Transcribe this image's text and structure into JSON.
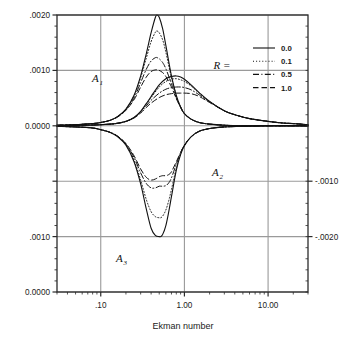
{
  "chart_data": {
    "type": "line",
    "title": "",
    "xlabel": "Ekman number",
    "ylabel": "",
    "xscale": "log",
    "xlim": [
      0.03,
      30.0
    ],
    "xticks": [
      0.1,
      1.0,
      10.0
    ],
    "xticklabels": [
      ".10",
      "1.00",
      "10.00"
    ],
    "grid": true,
    "grid_color": "#9a9a9a",
    "axes_color": "#2b2b2b",
    "background": "#ffffff",
    "left_axis": {
      "ticks_value": [
        0.002,
        0.001,
        0.0,
        -0.001,
        -0.002,
        -0.003
      ],
      "ticklabels": [
        ".0020",
        ".0010",
        "0.0000",
        "",
        ".0010",
        "0.0000"
      ],
      "ylim": [
        -0.003,
        0.002
      ]
    },
    "right_axis": {
      "ticks_value": [
        -0.001,
        -0.002
      ],
      "ticklabels": [
        "-.0010",
        "-.0020"
      ]
    },
    "legend": {
      "title": "R =",
      "position": "top-right",
      "entries": [
        {
          "label": "0.0",
          "style": "solid"
        },
        {
          "label": "0.1",
          "style": "dotted"
        },
        {
          "label": "0.5",
          "style": "dashdot"
        },
        {
          "label": "1.0",
          "style": "dashed"
        }
      ]
    },
    "annotations": [
      {
        "text": "A",
        "sub": "1",
        "x_px": 92,
        "y_px": 82
      },
      {
        "text": "A",
        "sub": "2",
        "x_px": 212,
        "y_px": 176
      },
      {
        "text": "A",
        "sub": "3",
        "x_px": 116,
        "y_px": 262
      }
    ],
    "series_groups": [
      {
        "name": "A1",
        "description": "Upper positive lobe, peak near E = 0.47",
        "series": [
          {
            "name": "R = 0.0",
            "style": "solid",
            "x": [
              0.03,
              0.05,
              0.08,
              0.1,
              0.13,
              0.16,
              0.2,
              0.25,
              0.3,
              0.35,
              0.4,
              0.45,
              0.47,
              0.5,
              0.55,
              0.6,
              0.7,
              0.8,
              0.9,
              1.0,
              1.2,
              1.5,
              2.0,
              3.0,
              5.0,
              10.0,
              20.0,
              30.0
            ],
            "y": [
              1e-05,
              2e-05,
              4e-05,
              6e-05,
              0.0001,
              0.00017,
              0.0003,
              0.00055,
              0.0009,
              0.0013,
              0.00168,
              0.00196,
              0.002,
              0.00196,
              0.00175,
              0.00145,
              0.0009,
              0.00055,
              0.00034,
              0.00022,
              0.00012,
              6e-05,
              3e-05,
              1e-05,
              0.0,
              0.0,
              0.0,
              0.0
            ]
          },
          {
            "name": "R = 0.1",
            "style": "dotted",
            "x": [
              0.03,
              0.05,
              0.08,
              0.1,
              0.13,
              0.16,
              0.2,
              0.25,
              0.3,
              0.35,
              0.4,
              0.45,
              0.47,
              0.5,
              0.55,
              0.6,
              0.7,
              0.8,
              0.9,
              1.0,
              1.2,
              1.5,
              2.0,
              3.0,
              5.0,
              10.0,
              20.0,
              30.0
            ],
            "y": [
              1e-05,
              2e-05,
              4e-05,
              6e-05,
              0.0001,
              0.00017,
              0.0003,
              0.00054,
              0.00087,
              0.00122,
              0.00152,
              0.00169,
              0.00171,
              0.00168,
              0.00155,
              0.00133,
              0.00087,
              0.00054,
              0.00034,
              0.00022,
              0.00012,
              6e-05,
              3e-05,
              1e-05,
              0.0,
              0.0,
              0.0,
              0.0
            ]
          },
          {
            "name": "R = 0.5",
            "style": "dashdot",
            "x": [
              0.03,
              0.05,
              0.08,
              0.1,
              0.13,
              0.16,
              0.2,
              0.25,
              0.3,
              0.35,
              0.4,
              0.45,
              0.47,
              0.5,
              0.55,
              0.6,
              0.7,
              0.8,
              0.9,
              1.0,
              1.2,
              1.5,
              2.0,
              3.0,
              5.0,
              10.0,
              20.0,
              30.0
            ],
            "y": [
              1e-05,
              2e-05,
              4e-05,
              6e-05,
              0.0001,
              0.00017,
              0.00029,
              0.0005,
              0.00078,
              0.00102,
              0.00117,
              0.00123,
              0.00123,
              0.00121,
              0.00114,
              0.00103,
              0.00076,
              0.00051,
              0.00034,
              0.00022,
              0.00012,
              6e-05,
              3e-05,
              1e-05,
              0.0,
              0.0,
              0.0,
              0.0
            ]
          },
          {
            "name": "R = 1.0",
            "style": "dashed",
            "x": [
              0.03,
              0.05,
              0.08,
              0.1,
              0.13,
              0.16,
              0.2,
              0.25,
              0.3,
              0.35,
              0.4,
              0.45,
              0.47,
              0.5,
              0.55,
              0.6,
              0.7,
              0.8,
              0.9,
              1.0,
              1.2,
              1.5,
              2.0,
              3.0,
              5.0,
              10.0,
              20.0,
              30.0
            ],
            "y": [
              1e-05,
              2e-05,
              4e-05,
              6e-05,
              0.0001,
              0.00016,
              0.00028,
              0.00047,
              0.0007,
              0.00088,
              0.00098,
              0.00101,
              0.00101,
              0.001,
              0.00096,
              0.00089,
              0.0007,
              0.00049,
              0.00033,
              0.00022,
              0.00012,
              6e-05,
              3e-05,
              1e-05,
              0.0,
              0.0,
              0.0,
              0.0
            ]
          }
        ]
      },
      {
        "name": "A2",
        "description": "Lower negative lobe, minimum near E = 0.52",
        "series": [
          {
            "name": "R = 0.0",
            "style": "solid",
            "x": [
              0.03,
              0.05,
              0.08,
              0.1,
              0.13,
              0.16,
              0.2,
              0.25,
              0.3,
              0.35,
              0.4,
              0.45,
              0.5,
              0.52,
              0.55,
              0.6,
              0.65,
              0.7,
              0.8,
              0.9,
              1.0,
              1.2,
              1.5,
              2.0,
              3.0,
              5.0,
              10.0,
              20.0,
              30.0
            ],
            "y": [
              -1e-05,
              -2e-05,
              -4e-05,
              -7e-05,
              -0.00012,
              -0.0002,
              -0.00035,
              -0.00065,
              -0.00105,
              -0.0015,
              -0.00185,
              -0.00198,
              -0.002,
              -0.002,
              -0.00196,
              -0.0018,
              -0.00155,
              -0.00128,
              -0.0008,
              -0.00052,
              -0.00036,
              -0.0002,
              -0.0001,
              -5e-05,
              -2e-05,
              -1e-05,
              0.0,
              0.0,
              0.0
            ]
          },
          {
            "name": "R = 0.1",
            "style": "dotted",
            "x": [
              0.03,
              0.05,
              0.08,
              0.1,
              0.13,
              0.16,
              0.2,
              0.25,
              0.3,
              0.35,
              0.4,
              0.45,
              0.5,
              0.52,
              0.55,
              0.6,
              0.65,
              0.7,
              0.8,
              0.9,
              1.0,
              1.2,
              1.5,
              2.0,
              3.0,
              5.0,
              10.0,
              20.0,
              30.0
            ],
            "y": [
              -1e-05,
              -2e-05,
              -4e-05,
              -7e-05,
              -0.00012,
              -0.0002,
              -0.00034,
              -0.00062,
              -0.00098,
              -0.00133,
              -0.00155,
              -0.00164,
              -0.00166,
              -0.00166,
              -0.00163,
              -0.00152,
              -0.00135,
              -0.00115,
              -0.00076,
              -0.00051,
              -0.00035,
              -0.0002,
              -0.0001,
              -5e-05,
              -2e-05,
              -1e-05,
              0.0,
              0.0,
              0.0
            ]
          },
          {
            "name": "R = 0.5",
            "style": "dashdot",
            "x": [
              0.03,
              0.05,
              0.08,
              0.1,
              0.13,
              0.16,
              0.2,
              0.25,
              0.3,
              0.35,
              0.4,
              0.45,
              0.5,
              0.52,
              0.55,
              0.6,
              0.65,
              0.7,
              0.8,
              0.9,
              1.0,
              1.2,
              1.5,
              2.0,
              3.0,
              5.0,
              10.0,
              20.0,
              30.0
            ],
            "y": [
              -1e-05,
              -2e-05,
              -4e-05,
              -7e-05,
              -0.00012,
              -0.00019,
              -0.00033,
              -0.00057,
              -0.00085,
              -0.00104,
              -0.00112,
              -0.00112,
              -0.00109,
              -0.00109,
              -0.00109,
              -0.00108,
              -0.00103,
              -0.00094,
              -0.00069,
              -0.00049,
              -0.00035,
              -0.0002,
              -0.0001,
              -5e-05,
              -2e-05,
              -1e-05,
              0.0,
              0.0,
              0.0
            ]
          },
          {
            "name": "R = 1.0",
            "style": "dashed",
            "x": [
              0.03,
              0.05,
              0.08,
              0.1,
              0.13,
              0.16,
              0.2,
              0.25,
              0.3,
              0.35,
              0.4,
              0.45,
              0.5,
              0.52,
              0.55,
              0.6,
              0.65,
              0.7,
              0.8,
              0.9,
              1.0,
              1.2,
              1.5,
              2.0,
              3.0,
              5.0,
              10.0,
              20.0,
              30.0
            ],
            "y": [
              -1e-05,
              -2e-05,
              -4e-05,
              -7e-05,
              -0.00012,
              -0.00019,
              -0.00032,
              -0.00054,
              -0.00078,
              -0.00093,
              -0.00098,
              -0.00096,
              -0.00092,
              -0.00091,
              -0.0009,
              -0.0009,
              -0.00088,
              -0.00083,
              -0.00065,
              -0.00048,
              -0.00035,
              -0.0002,
              -0.0001,
              -5e-05,
              -2e-05,
              -1e-05,
              0.0,
              0.0,
              0.0
            ]
          }
        ]
      },
      {
        "name": "A3",
        "description": "Bottom panel lobe, peak near E = 0.9",
        "series": [
          {
            "name": "R = 0.0",
            "style": "solid",
            "x": [
              0.03,
              0.06,
              0.1,
              0.15,
              0.2,
              0.25,
              0.3,
              0.35,
              0.4,
              0.5,
              0.6,
              0.7,
              0.8,
              0.9,
              1.0,
              1.2,
              1.5,
              2.0,
              3.0,
              4.0,
              6.0,
              10.0,
              15.0,
              20.0,
              30.0
            ],
            "y": [
              5e-06,
              1e-05,
              2e-05,
              4e-05,
              8e-05,
              0.00015,
              0.00026,
              0.0004,
              0.00053,
              0.00074,
              0.00085,
              0.00089,
              0.0009,
              0.00088,
              0.00084,
              0.00074,
              0.0006,
              0.00044,
              0.00027,
              0.0002,
              0.00013,
              8e-05,
              5e-05,
              4e-05,
              2e-05
            ]
          },
          {
            "name": "R = 0.1",
            "style": "dotted",
            "x": [
              0.03,
              0.06,
              0.1,
              0.15,
              0.2,
              0.25,
              0.3,
              0.35,
              0.4,
              0.5,
              0.6,
              0.7,
              0.8,
              0.9,
              1.0,
              1.2,
              1.5,
              2.0,
              3.0,
              4.0,
              6.0,
              10.0,
              15.0,
              20.0,
              30.0
            ],
            "y": [
              5e-06,
              1e-05,
              2e-05,
              4e-05,
              8e-05,
              0.00015,
              0.00026,
              0.00039,
              0.00051,
              0.0007,
              0.0008,
              0.00084,
              0.00085,
              0.00083,
              0.0008,
              0.00072,
              0.00059,
              0.00044,
              0.00027,
              0.0002,
              0.00013,
              8e-05,
              5e-05,
              4e-05,
              2e-05
            ]
          },
          {
            "name": "R = 0.5",
            "style": "dashdot",
            "x": [
              0.03,
              0.06,
              0.1,
              0.15,
              0.2,
              0.25,
              0.3,
              0.35,
              0.4,
              0.5,
              0.6,
              0.7,
              0.8,
              0.9,
              1.0,
              1.2,
              1.5,
              2.0,
              3.0,
              4.0,
              6.0,
              10.0,
              15.0,
              20.0,
              30.0
            ],
            "y": [
              5e-06,
              1e-05,
              2e-05,
              4e-05,
              8e-05,
              0.00015,
              0.00025,
              0.00036,
              0.00046,
              0.00059,
              0.00066,
              0.00069,
              0.0007,
              0.0007,
              0.00069,
              0.00065,
              0.00056,
              0.00043,
              0.00027,
              0.0002,
              0.00013,
              8e-05,
              5e-05,
              4e-05,
              2e-05
            ]
          },
          {
            "name": "R = 1.0",
            "style": "dashed",
            "x": [
              0.03,
              0.06,
              0.1,
              0.15,
              0.2,
              0.25,
              0.3,
              0.35,
              0.4,
              0.5,
              0.6,
              0.7,
              0.8,
              0.9,
              1.0,
              1.2,
              1.5,
              2.0,
              3.0,
              4.0,
              6.0,
              10.0,
              15.0,
              20.0,
              30.0
            ],
            "y": [
              5e-06,
              1e-05,
              2e-05,
              4e-05,
              8e-05,
              0.00014,
              0.00023,
              0.00033,
              0.00041,
              0.00051,
              0.00056,
              0.00058,
              0.00059,
              0.00059,
              0.00059,
              0.00058,
              0.00053,
              0.00042,
              0.00027,
              0.0002,
              0.00013,
              8e-05,
              5e-05,
              4e-05,
              2e-05
            ]
          }
        ]
      }
    ]
  }
}
